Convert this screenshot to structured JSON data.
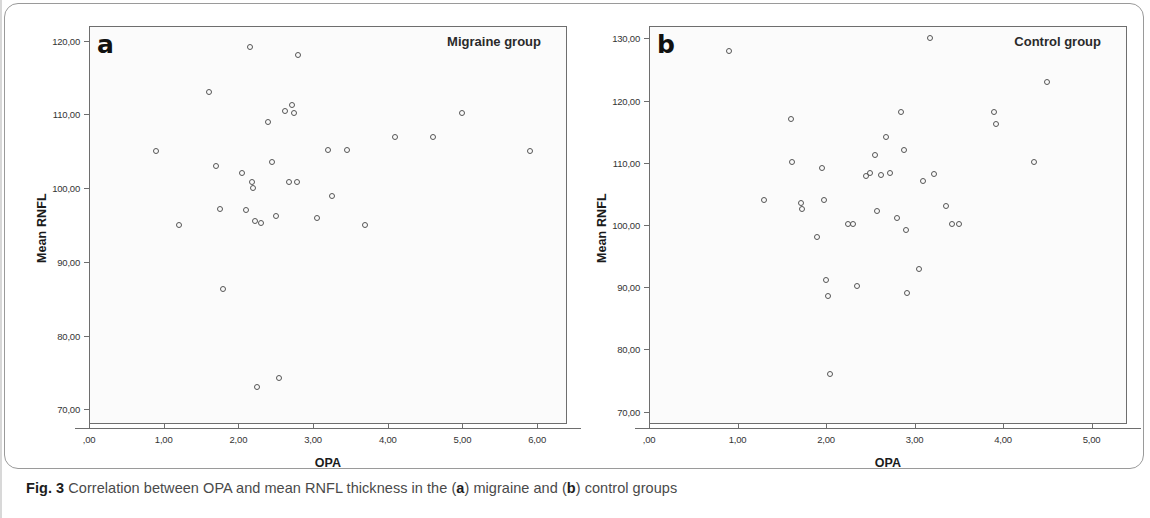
{
  "caption": {
    "lead": "Fig. 3",
    "text_1": " Correlation between OPA and mean RNFL thickness in the (",
    "bold_a": "a",
    "text_2": ") migraine and (",
    "bold_b": "b",
    "text_3": ") control groups"
  },
  "panel_a": {
    "letter": "a",
    "title": "Migraine group",
    "xlabel": "OPA",
    "ylabel": "Mean RNFL",
    "xticks": [
      ",00",
      "1,00",
      "2,00",
      "3,00",
      "4,00",
      "5,00",
      "6,00"
    ],
    "yticks": [
      "120,00",
      "110,00",
      "100,00",
      "90,00",
      "80,00",
      "70,00"
    ]
  },
  "panel_b": {
    "letter": "b",
    "title": "Control group",
    "xlabel": "OPA",
    "ylabel": "Mean RNFL",
    "xticks": [
      ",00",
      "1,00",
      "2,00",
      "3,00",
      "4,00",
      "5,00"
    ],
    "yticks": [
      "130,00",
      "120,00",
      "110,00",
      "100,00",
      "90,00",
      "80,00",
      "70,00"
    ]
  },
  "chart_data": [
    {
      "type": "scatter",
      "id": "panel-a",
      "title": "Migraine group",
      "panel_label": "a",
      "xlabel": "OPA",
      "ylabel": "Mean RNFL",
      "xlim": [
        0.0,
        6.4
      ],
      "ylim": [
        68.0,
        122.0
      ],
      "xticks": [
        0.0,
        1.0,
        2.0,
        3.0,
        4.0,
        5.0,
        6.0
      ],
      "yticks": [
        70.0,
        80.0,
        90.0,
        100.0,
        110.0,
        120.0
      ],
      "grid": false,
      "legend": null,
      "marker": "open-circle",
      "points": [
        {
          "x": 0.9,
          "y": 105.0
        },
        {
          "x": 1.2,
          "y": 95.0
        },
        {
          "x": 1.6,
          "y": 113.0
        },
        {
          "x": 1.7,
          "y": 103.0
        },
        {
          "x": 1.75,
          "y": 97.2
        },
        {
          "x": 1.8,
          "y": 86.3
        },
        {
          "x": 2.05,
          "y": 102.0
        },
        {
          "x": 2.1,
          "y": 97.0
        },
        {
          "x": 2.15,
          "y": 119.2
        },
        {
          "x": 2.18,
          "y": 100.8
        },
        {
          "x": 2.2,
          "y": 100.0
        },
        {
          "x": 2.22,
          "y": 95.5
        },
        {
          "x": 2.25,
          "y": 73.0
        },
        {
          "x": 2.3,
          "y": 95.3
        },
        {
          "x": 2.4,
          "y": 109.0
        },
        {
          "x": 2.45,
          "y": 103.5
        },
        {
          "x": 2.5,
          "y": 96.2
        },
        {
          "x": 2.55,
          "y": 74.2
        },
        {
          "x": 2.62,
          "y": 110.5
        },
        {
          "x": 2.68,
          "y": 100.9
        },
        {
          "x": 2.72,
          "y": 111.3
        },
        {
          "x": 2.74,
          "y": 110.2
        },
        {
          "x": 2.78,
          "y": 100.8
        },
        {
          "x": 2.8,
          "y": 118.0
        },
        {
          "x": 3.05,
          "y": 96.0
        },
        {
          "x": 3.2,
          "y": 105.2
        },
        {
          "x": 3.25,
          "y": 99.0
        },
        {
          "x": 3.45,
          "y": 105.2
        },
        {
          "x": 3.7,
          "y": 95.0
        },
        {
          "x": 4.1,
          "y": 107.0
        },
        {
          "x": 4.6,
          "y": 107.0
        },
        {
          "x": 5.0,
          "y": 110.2
        },
        {
          "x": 5.9,
          "y": 105.0
        }
      ]
    },
    {
      "type": "scatter",
      "id": "panel-b",
      "title": "Control group",
      "panel_label": "b",
      "xlabel": "OPA",
      "ylabel": "Mean RNFL",
      "xlim": [
        0.0,
        5.4
      ],
      "ylim": [
        68.0,
        132.0
      ],
      "xticks": [
        0.0,
        1.0,
        2.0,
        3.0,
        4.0,
        5.0
      ],
      "yticks": [
        70.0,
        80.0,
        90.0,
        100.0,
        110.0,
        120.0,
        130.0
      ],
      "grid": false,
      "legend": null,
      "marker": "open-circle",
      "points": [
        {
          "x": 0.9,
          "y": 128.0
        },
        {
          "x": 1.3,
          "y": 104.0
        },
        {
          "x": 1.6,
          "y": 117.0
        },
        {
          "x": 1.62,
          "y": 110.2
        },
        {
          "x": 1.72,
          "y": 103.5
        },
        {
          "x": 1.73,
          "y": 102.6
        },
        {
          "x": 1.9,
          "y": 98.0
        },
        {
          "x": 1.95,
          "y": 109.2
        },
        {
          "x": 1.98,
          "y": 104.0
        },
        {
          "x": 2.0,
          "y": 91.2
        },
        {
          "x": 2.02,
          "y": 88.6
        },
        {
          "x": 2.05,
          "y": 76.0
        },
        {
          "x": 2.25,
          "y": 100.2
        },
        {
          "x": 2.3,
          "y": 100.2
        },
        {
          "x": 2.35,
          "y": 90.2
        },
        {
          "x": 2.45,
          "y": 107.8
        },
        {
          "x": 2.5,
          "y": 108.3
        },
        {
          "x": 2.55,
          "y": 111.2
        },
        {
          "x": 2.58,
          "y": 102.2
        },
        {
          "x": 2.62,
          "y": 108.0
        },
        {
          "x": 2.68,
          "y": 114.2
        },
        {
          "x": 2.72,
          "y": 108.4
        },
        {
          "x": 2.8,
          "y": 101.2
        },
        {
          "x": 2.85,
          "y": 118.2
        },
        {
          "x": 2.88,
          "y": 112.0
        },
        {
          "x": 2.9,
          "y": 99.2
        },
        {
          "x": 2.92,
          "y": 89.0
        },
        {
          "x": 3.05,
          "y": 93.0
        },
        {
          "x": 3.1,
          "y": 107.0
        },
        {
          "x": 3.18,
          "y": 130.0
        },
        {
          "x": 3.22,
          "y": 108.2
        },
        {
          "x": 3.35,
          "y": 103.0
        },
        {
          "x": 3.42,
          "y": 100.2
        },
        {
          "x": 3.5,
          "y": 100.2
        },
        {
          "x": 3.9,
          "y": 118.2
        },
        {
          "x": 3.92,
          "y": 116.2
        },
        {
          "x": 4.35,
          "y": 110.2
        },
        {
          "x": 4.5,
          "y": 123.0
        }
      ]
    }
  ]
}
